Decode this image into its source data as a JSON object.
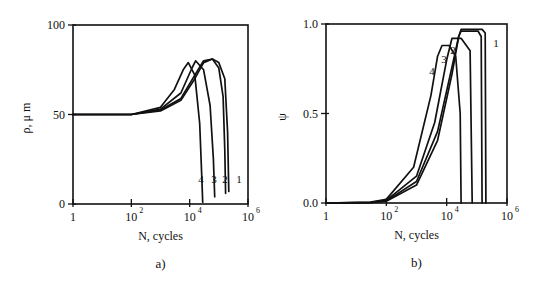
{
  "panels": [
    {
      "id": "a",
      "panel_label": "a)",
      "xlabel": "N, cycles",
      "ylabel": "ρ, μ m",
      "y_ticks": [
        "100",
        "50",
        "0"
      ],
      "x_ticks": [
        {
          "base": "1",
          "exp": ""
        },
        {
          "base": "10",
          "exp": "2"
        },
        {
          "base": "10",
          "exp": "4"
        },
        {
          "base": "10",
          "exp": "6"
        }
      ],
      "curve_labels": [
        "4",
        "3",
        "2",
        "1"
      ]
    },
    {
      "id": "b",
      "panel_label": "b)",
      "xlabel": "N, cycles",
      "ylabel": "ψ",
      "y_ticks": [
        "1.0",
        "0.5",
        "0.0"
      ],
      "x_ticks": [
        {
          "base": "1",
          "exp": ""
        },
        {
          "base": "10",
          "exp": "2"
        },
        {
          "base": "10",
          "exp": "4"
        },
        {
          "base": "10",
          "exp": "6"
        }
      ],
      "curve_labels": [
        "4",
        "3",
        "2",
        "1"
      ]
    }
  ],
  "chart_data": [
    {
      "type": "line",
      "title": "a)",
      "xlabel": "N, cycles",
      "ylabel": "ρ, μm",
      "xscale": "log",
      "xlim": [
        1,
        1000000
      ],
      "ylim": [
        0,
        100
      ],
      "x_ticks": [
        1,
        100,
        10000,
        1000000
      ],
      "y_ticks": [
        0,
        50,
        100
      ],
      "grid": false,
      "series": [
        {
          "name": "1",
          "x": [
            1,
            100,
            1000,
            5000,
            15000,
            30000,
            60000,
            100000,
            160000,
            200000,
            220000
          ],
          "y": [
            50,
            50,
            52,
            58,
            70,
            79,
            81,
            79,
            70,
            40,
            7
          ]
        },
        {
          "name": "2",
          "x": [
            1,
            100,
            1000,
            5000,
            15000,
            30000,
            60000,
            100000,
            140000,
            160000,
            170000
          ],
          "y": [
            50,
            50,
            52.5,
            59,
            72,
            80,
            81,
            76,
            60,
            30,
            6
          ]
        },
        {
          "name": "3",
          "x": [
            1,
            100,
            1000,
            5000,
            12000,
            16000,
            30000,
            50000,
            65000,
            72000
          ],
          "y": [
            50,
            50,
            53,
            62,
            76,
            80,
            75,
            55,
            25,
            4
          ]
        },
        {
          "name": "4",
          "x": [
            1,
            100,
            1000,
            3000,
            6000,
            9000,
            15000,
            22000,
            26000,
            28000
          ],
          "y": [
            50,
            50,
            54,
            64,
            75,
            79,
            72,
            45,
            15,
            1
          ]
        }
      ]
    },
    {
      "type": "line",
      "title": "b)",
      "xlabel": "N, cycles",
      "ylabel": "ψ",
      "xscale": "log",
      "xlim": [
        1,
        1000000
      ],
      "ylim": [
        0,
        1.0
      ],
      "x_ticks": [
        1,
        100,
        10000,
        1000000
      ],
      "y_ticks": [
        0.0,
        0.5,
        1.0
      ],
      "grid": false,
      "series": [
        {
          "name": "1",
          "x": [
            1,
            30,
            100,
            1000,
            5000,
            15000,
            25000,
            30000,
            150000,
            190000,
            200000
          ],
          "y": [
            0,
            0.002,
            0.01,
            0.1,
            0.35,
            0.72,
            0.93,
            0.97,
            0.97,
            0.95,
            0
          ]
        },
        {
          "name": "2",
          "x": [
            1,
            30,
            100,
            1000,
            5000,
            15000,
            25000,
            30000,
            110000,
            140000,
            150000
          ],
          "y": [
            0,
            0.003,
            0.012,
            0.12,
            0.4,
            0.76,
            0.93,
            0.96,
            0.96,
            0.93,
            0
          ]
        },
        {
          "name": "3",
          "x": [
            1,
            30,
            100,
            1000,
            4000,
            10000,
            15000,
            30000,
            60000,
            70000
          ],
          "y": [
            0,
            0.004,
            0.015,
            0.15,
            0.45,
            0.8,
            0.92,
            0.92,
            0.85,
            0
          ]
        },
        {
          "name": "4",
          "x": [
            1,
            30,
            100,
            800,
            3000,
            5000,
            7000,
            12000,
            20000,
            28000,
            30000
          ],
          "y": [
            0,
            0.005,
            0.02,
            0.2,
            0.6,
            0.82,
            0.88,
            0.88,
            0.82,
            0.5,
            0
          ]
        }
      ]
    }
  ]
}
